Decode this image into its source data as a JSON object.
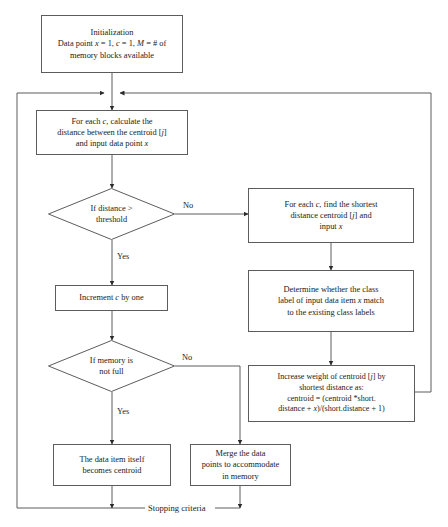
{
  "diagram": {
    "type": "flowchart",
    "background_color": "#ffffff",
    "stroke_color": "#5c5c5c",
    "text_color": "#1a1a1a"
  },
  "nodes": {
    "initialization": {
      "shape": "process",
      "text": "Initialization\nData point x = 1, c = 1, M = # of\nmemory blocks available"
    },
    "calculate_distance": {
      "shape": "process",
      "text": "For each c, calculate the\ndistance between the centroid [j]\nand input data point x"
    },
    "distance_threshold": {
      "shape": "decision",
      "text": "If distance >\nthreshold"
    },
    "increment_c": {
      "shape": "process",
      "text": "Increment c by one"
    },
    "memory_not_full": {
      "shape": "decision",
      "text": "If memory is\nnot full"
    },
    "data_item_becomes_centroid": {
      "shape": "process",
      "text": "The data item itself\nbecomes centroid"
    },
    "find_shortest": {
      "shape": "process",
      "text": "For each c, find the shortest\ndistance centroid [j] and\ninput x"
    },
    "determine_class_label": {
      "shape": "process",
      "text": "Determine whether the class\nlabel of input data item x match\nto the existing class labels"
    },
    "increase_weight": {
      "shape": "process",
      "text": "Increase weight of centroid [j] by\nshortest distance as:\ncentroid = (centroid *short.\ndistance + x)/(short.distance + 1)"
    },
    "merge_data_points": {
      "shape": "process",
      "text": "Merge the data\npoints to accommodate\nin memory"
    }
  },
  "edge_labels": {
    "distance_no": "No",
    "distance_yes": "Yes",
    "memory_no": "No",
    "memory_yes": "Yes",
    "stopping_criteria": "Stopping criteria"
  }
}
